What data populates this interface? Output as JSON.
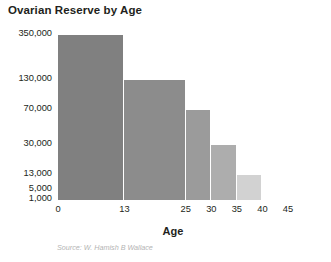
{
  "chart_data": {
    "type": "bar",
    "title": "Ovarian Reserve by Age",
    "xlabel": "Age",
    "ylabel": "",
    "source": "Source: W. Hamish B Wallace",
    "grid": false,
    "legend": "none",
    "xlim": [
      0,
      45
    ],
    "x_ticks": [
      "0",
      "13",
      "25",
      "30",
      "35",
      "40",
      "45"
    ],
    "x_tick_values": [
      0,
      13,
      25,
      30,
      35,
      40,
      45
    ],
    "y_ticks": [
      "1,000",
      "5,000",
      "13,000",
      "30,000",
      "70,000",
      "130,000",
      "350,000"
    ],
    "y_tick_values": [
      1000,
      5000,
      13000,
      30000,
      70000,
      130000,
      350000
    ],
    "y_axis_scale": "nonlinear",
    "categories": [
      "0-13",
      "13-25",
      "25-30",
      "30-35",
      "35-40"
    ],
    "values": [
      350000,
      130000,
      70000,
      30000,
      13000
    ],
    "bars": [
      {
        "label": "0-13",
        "x_start": 0,
        "x_end": 13,
        "value": 350000,
        "color": "#808080"
      },
      {
        "label": "13-25",
        "x_start": 13,
        "x_end": 25,
        "value": 130000,
        "color": "#8c8c8c"
      },
      {
        "label": "25-30",
        "x_start": 25,
        "x_end": 30,
        "value": 70000,
        "color": "#9b9b9b"
      },
      {
        "label": "30-35",
        "x_start": 30,
        "x_end": 35,
        "value": 30000,
        "color": "#adadad"
      },
      {
        "label": "35-40",
        "x_start": 35,
        "x_end": 40,
        "value": 13000,
        "color": "#d2d2d2"
      }
    ]
  },
  "colors": {
    "background": "#ffffff",
    "text": "#231f20",
    "source_text": "#b4b4b4"
  }
}
